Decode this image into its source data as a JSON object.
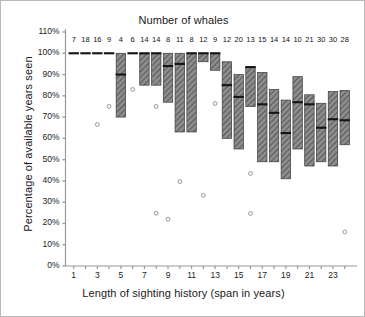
{
  "chart_data": {
    "type": "box",
    "title": "Number of whales",
    "xlabel": "Length of  sighting  history (span in years)",
    "ylabel": "Percentage of available years seen",
    "grid": false,
    "legend": "none",
    "xlim": [
      0.3,
      24.7
    ],
    "ylim": [
      0,
      110
    ],
    "ytick_labels": [
      "0%",
      "10%",
      "20%",
      "30%",
      "40%",
      "50%",
      "60%",
      "70%",
      "80%",
      "90%",
      "100%",
      "110%"
    ],
    "ytick_values": [
      0,
      10,
      20,
      30,
      40,
      50,
      60,
      70,
      80,
      90,
      100,
      110
    ],
    "xtick_values": [
      1,
      2,
      3,
      4,
      5,
      6,
      7,
      8,
      9,
      10,
      11,
      12,
      13,
      14,
      15,
      16,
      17,
      18,
      19,
      20,
      21,
      22,
      23,
      24
    ],
    "xtick_labels": [
      "1",
      "",
      "3",
      "",
      "5",
      "",
      "7",
      "",
      "9",
      "",
      "11",
      "",
      "13",
      "",
      "15",
      "",
      "17",
      "",
      "19",
      "",
      "21",
      "",
      "23",
      ""
    ],
    "counts_header": "Number of whales",
    "categories": [
      1,
      2,
      3,
      4,
      5,
      6,
      7,
      8,
      9,
      10,
      11,
      12,
      13,
      14,
      15,
      16,
      17,
      18,
      19,
      20,
      21,
      22,
      23,
      24
    ],
    "counts": [
      7,
      18,
      16,
      9,
      4,
      6,
      14,
      14,
      8,
      11,
      8,
      12,
      9,
      12,
      20,
      13,
      15,
      14,
      14,
      10,
      21,
      30,
      30,
      28
    ],
    "boxes": [
      {
        "x": 1,
        "n": 7,
        "low": 100,
        "high": 100,
        "median": 100
      },
      {
        "x": 2,
        "n": 18,
        "low": 100,
        "high": 100,
        "median": 100
      },
      {
        "x": 3,
        "n": 16,
        "low": 100,
        "high": 100,
        "median": 100
      },
      {
        "x": 4,
        "n": 9,
        "low": 100,
        "high": 100,
        "median": 100
      },
      {
        "x": 5,
        "n": 4,
        "low": 70,
        "high": 100,
        "median": 90
      },
      {
        "x": 6,
        "n": 6,
        "low": 100,
        "high": 100,
        "median": 100
      },
      {
        "x": 7,
        "n": 14,
        "low": 85,
        "high": 100,
        "median": 100
      },
      {
        "x": 8,
        "n": 14,
        "low": 85,
        "high": 100,
        "median": 100
      },
      {
        "x": 9,
        "n": 8,
        "low": 77,
        "high": 100,
        "median": 94
      },
      {
        "x": 10,
        "n": 11,
        "low": 63,
        "high": 100,
        "median": 95
      },
      {
        "x": 11,
        "n": 8,
        "low": 63,
        "high": 100,
        "median": 100
      },
      {
        "x": 12,
        "n": 12,
        "low": 96,
        "high": 100,
        "median": 100
      },
      {
        "x": 13,
        "n": 9,
        "low": 92,
        "high": 100,
        "median": 100
      },
      {
        "x": 14,
        "n": 12,
        "low": 60,
        "high": 96,
        "median": 85
      },
      {
        "x": 15,
        "n": 20,
        "low": 55,
        "high": 90,
        "median": 79.5
      },
      {
        "x": 16,
        "n": 13,
        "low": 75,
        "high": 93.5,
        "median": 93.5
      },
      {
        "x": 17,
        "n": 15,
        "low": 49,
        "high": 91,
        "median": 76
      },
      {
        "x": 18,
        "n": 14,
        "low": 49,
        "high": 83,
        "median": 72
      },
      {
        "x": 19,
        "n": 14,
        "low": 41,
        "high": 78,
        "median": 62.5
      },
      {
        "x": 20,
        "n": 10,
        "low": 55,
        "high": 89,
        "median": 77
      },
      {
        "x": 21,
        "n": 21,
        "low": 47,
        "high": 80.5,
        "median": 76
      },
      {
        "x": 22,
        "n": 30,
        "low": 49,
        "high": 76.5,
        "median": 65
      },
      {
        "x": 23,
        "n": 30,
        "low": 47,
        "high": 82,
        "median": 69
      },
      {
        "x": 24,
        "n": 28,
        "low": 57,
        "high": 82.5,
        "median": 68.5
      }
    ],
    "outliers": [
      {
        "x": 3,
        "y": 66.5
      },
      {
        "x": 4,
        "y": 75
      },
      {
        "x": 6,
        "y": 83
      },
      {
        "x": 8,
        "y": 87
      },
      {
        "x": 8,
        "y": 75
      },
      {
        "x": 8,
        "y": 24.8
      },
      {
        "x": 9,
        "y": 22
      },
      {
        "x": 10,
        "y": 39.7
      },
      {
        "x": 12,
        "y": 33.2
      },
      {
        "x": 13,
        "y": 76.4
      },
      {
        "x": 16,
        "y": 43.5
      },
      {
        "x": 16,
        "y": 24.7
      },
      {
        "x": 24,
        "y": 16
      }
    ],
    "colors": {
      "box_fill": "#8c8c8c",
      "box_hatch": "#5a5a5a",
      "box_edge": "#3a3a3a",
      "median": "#141414",
      "outlier_edge": "#8a8a8a",
      "axis": "#9a9a9a",
      "text": "#1a1a1a",
      "background": "#ffffff",
      "frame": "#b9b9b9"
    }
  }
}
